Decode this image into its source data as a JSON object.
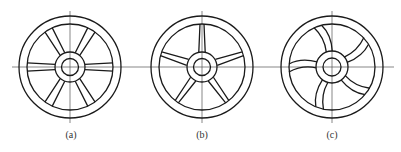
{
  "figure": {
    "panels": [
      {
        "id": "a",
        "label": "(a)",
        "spokes": 6,
        "spoke_style": "straight-tapered"
      },
      {
        "id": "b",
        "label": "(b)",
        "spokes": 5,
        "spoke_style": "straight-tapered"
      },
      {
        "id": "c",
        "label": "(c)",
        "spokes": 5,
        "spoke_style": "curved"
      }
    ]
  }
}
